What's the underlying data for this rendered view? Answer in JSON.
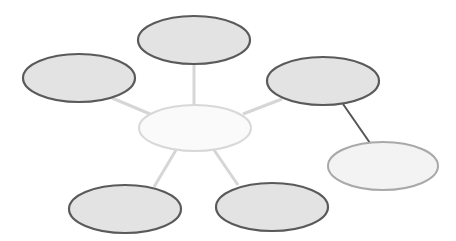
{
  "diagram": {
    "type": "mind-map",
    "colors": {
      "background": "#ffffff",
      "node_fill": "#e3e3e3",
      "node_stroke": "#5a5a5a",
      "center_fill": "#fafafa",
      "center_stroke": "#d8d8d8",
      "light_fill": "#f3f3f3",
      "light_stroke": "#a9a9a9",
      "connector_light": "#d6d6d6",
      "connector_dark": "#555555"
    },
    "nodes": [
      {
        "id": "center",
        "label": "",
        "cx": 195,
        "cy": 128,
        "rx": 56,
        "ry": 23
      },
      {
        "id": "top",
        "label": "",
        "cx": 194,
        "cy": 40,
        "rx": 56,
        "ry": 24
      },
      {
        "id": "top-left",
        "label": "",
        "cx": 79,
        "cy": 78,
        "rx": 56,
        "ry": 24
      },
      {
        "id": "top-right",
        "label": "",
        "cx": 323,
        "cy": 81,
        "rx": 56,
        "ry": 24
      },
      {
        "id": "bottom-left",
        "label": "",
        "cx": 125,
        "cy": 209,
        "rx": 56,
        "ry": 24
      },
      {
        "id": "bottom-right",
        "label": "",
        "cx": 272,
        "cy": 207,
        "rx": 56,
        "ry": 24
      },
      {
        "id": "far-right",
        "label": "",
        "cx": 383,
        "cy": 166,
        "rx": 55,
        "ry": 24
      }
    ],
    "edges": [
      {
        "from": "center",
        "to": "top"
      },
      {
        "from": "center",
        "to": "top-left"
      },
      {
        "from": "center",
        "to": "top-right"
      },
      {
        "from": "center",
        "to": "bottom-left"
      },
      {
        "from": "center",
        "to": "bottom-right"
      },
      {
        "from": "top-right",
        "to": "far-right"
      }
    ]
  }
}
